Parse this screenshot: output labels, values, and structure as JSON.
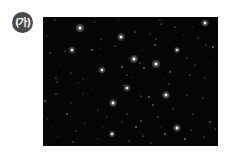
{
  "figure": {
    "label": "(가)",
    "image": {
      "description": "star field",
      "background": "#050505",
      "star_color": "#ffffff",
      "stars": [
        [
          37,
          11,
          2.2,
          1.0
        ],
        [
          12,
          3,
          0.9,
          0.6
        ],
        [
          52,
          5,
          0.8,
          0.5
        ],
        [
          75,
          3,
          0.8,
          0.5
        ],
        [
          4,
          19,
          0.9,
          0.6
        ],
        [
          58,
          22,
          0.9,
          0.6
        ],
        [
          78,
          20,
          2.0,
          0.9
        ],
        [
          57,
          31,
          0.8,
          0.5
        ],
        [
          22,
          34,
          0.9,
          0.6
        ],
        [
          7,
          36,
          1.0,
          0.7
        ],
        [
          29,
          33,
          1.8,
          0.95
        ],
        [
          49,
          33,
          1.2,
          0.8
        ],
        [
          72,
          29,
          1.0,
          0.6
        ],
        [
          85,
          41,
          0.8,
          0.5
        ],
        [
          59,
          53,
          1.8,
          0.95
        ],
        [
          79,
          50,
          1.3,
          0.8
        ],
        [
          28,
          56,
          0.9,
          0.6
        ],
        [
          13,
          61,
          0.9,
          0.6
        ],
        [
          40,
          62,
          0.8,
          0.5
        ],
        [
          84,
          58,
          1.0,
          0.6
        ],
        [
          117,
          3,
          0.9,
          0.6
        ],
        [
          118,
          7,
          0.9,
          0.6
        ],
        [
          132,
          10,
          1.0,
          0.7
        ],
        [
          162,
          6,
          1.9,
          0.95
        ],
        [
          92,
          15,
          1.0,
          0.7
        ],
        [
          107,
          17,
          0.9,
          0.6
        ],
        [
          113,
          22,
          1.0,
          0.6
        ],
        [
          155,
          21,
          1.0,
          0.7
        ],
        [
          112,
          28,
          1.2,
          0.8
        ],
        [
          163,
          28,
          1.0,
          0.6
        ],
        [
          134,
          33,
          1.6,
          0.9
        ],
        [
          170,
          30,
          1.3,
          0.8
        ],
        [
          91,
          42,
          2.1,
          1.0
        ],
        [
          144,
          41,
          0.9,
          0.6
        ],
        [
          113,
          47,
          2.1,
          1.0
        ],
        [
          97,
          46,
          1.0,
          0.7
        ],
        [
          101,
          51,
          1.2,
          0.8
        ],
        [
          127,
          55,
          1.1,
          0.7
        ],
        [
          147,
          58,
          1.0,
          0.6
        ],
        [
          162,
          61,
          1.0,
          0.6
        ],
        [
          14,
          65,
          0.9,
          0.6
        ],
        [
          35,
          66,
          0.8,
          0.5
        ],
        [
          84,
          71,
          1.8,
          0.95
        ],
        [
          81,
          68,
          1.0,
          0.6
        ],
        [
          13,
          77,
          1.0,
          0.7
        ],
        [
          40,
          77,
          0.8,
          0.5
        ],
        [
          2,
          84,
          1.2,
          0.8
        ],
        [
          28,
          86,
          0.8,
          0.5
        ],
        [
          70,
          86,
          2.0,
          1.0
        ],
        [
          98,
          79,
          0.9,
          0.6
        ],
        [
          55,
          93,
          0.9,
          0.6
        ],
        [
          24,
          97,
          1.1,
          0.7
        ],
        [
          84,
          97,
          1.0,
          0.7
        ],
        [
          4,
          102,
          0.8,
          0.5
        ],
        [
          64,
          100,
          0.9,
          0.6
        ],
        [
          42,
          106,
          0.8,
          0.5
        ],
        [
          79,
          105,
          1.0,
          0.6
        ],
        [
          106,
          80,
          1.2,
          0.8
        ],
        [
          123,
          78,
          2.0,
          1.0
        ],
        [
          144,
          78,
          0.9,
          0.6
        ],
        [
          160,
          81,
          1.0,
          0.6
        ],
        [
          110,
          88,
          1.1,
          0.7
        ],
        [
          130,
          92,
          0.9,
          0.6
        ],
        [
          150,
          97,
          1.0,
          0.6
        ],
        [
          134,
          111,
          2.0,
          1.0
        ],
        [
          98,
          104,
          1.1,
          0.7
        ],
        [
          115,
          100,
          1.0,
          0.7
        ],
        [
          167,
          105,
          1.1,
          0.7
        ],
        [
          93,
          110,
          1.2,
          0.8
        ],
        [
          148,
          113,
          1.0,
          0.6
        ],
        [
          122,
          117,
          1.3,
          0.8
        ],
        [
          100,
          119,
          1.0,
          0.6
        ],
        [
          69,
          117,
          1.7,
          0.95
        ],
        [
          33,
          114,
          0.9,
          0.6
        ],
        [
          15,
          119,
          0.8,
          0.5
        ],
        [
          55,
          122,
          0.8,
          0.5
        ],
        [
          86,
          124,
          0.9,
          0.6
        ],
        [
          142,
          122,
          1.2,
          0.8
        ],
        [
          161,
          120,
          0.9,
          0.6
        ],
        [
          108,
          126,
          0.9,
          0.6
        ],
        [
          30,
          125,
          1.0,
          0.6
        ],
        [
          172,
          112,
          1.0,
          0.6
        ],
        [
          126,
          67,
          1.0,
          0.6
        ],
        [
          152,
          48,
          0.9,
          0.5
        ],
        [
          65,
          42,
          0.7,
          0.4
        ],
        [
          45,
          48,
          0.7,
          0.4
        ],
        [
          18,
          48,
          0.7,
          0.4
        ],
        [
          100,
          33,
          0.7,
          0.4
        ],
        [
          140,
          18,
          0.7,
          0.4
        ],
        [
          167,
          46,
          0.7,
          0.4
        ],
        [
          120,
          62,
          0.7,
          0.4
        ],
        [
          50,
          72,
          0.7,
          0.4
        ],
        [
          60,
          110,
          0.7,
          0.4
        ],
        [
          118,
          110,
          0.7,
          0.4
        ],
        [
          155,
          90,
          0.7,
          0.4
        ],
        [
          90,
          60,
          0.7,
          0.4
        ],
        [
          25,
          10,
          0.7,
          0.4
        ],
        [
          66,
          15,
          0.7,
          0.4
        ],
        [
          150,
          10,
          0.7,
          0.4
        ],
        [
          8,
          110,
          0.7,
          0.4
        ]
      ]
    }
  }
}
